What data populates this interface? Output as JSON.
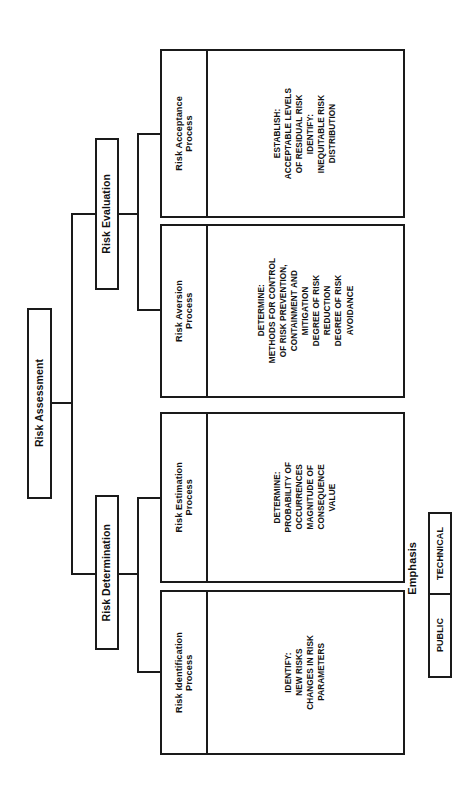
{
  "diagram": {
    "orientation": "rotated-90-counterclockwise",
    "root": {
      "label": "Risk Assessment"
    },
    "branches": [
      {
        "label": "Risk Evaluation"
      },
      {
        "label": "Risk Determination"
      }
    ],
    "processes": [
      {
        "title": "Risk Acceptance\nProcess",
        "body": "ESTABLISH:\nACCEPTABLE LEVELS\nOF RESIDUAL RISK\nIDENTIFY:\nINEQUITABLE RISK\nDISTRIBUTION"
      },
      {
        "title": "Risk Aversion\nProcess",
        "body": "DETERMINE:\nMETHODS FOR CONTROL\nOF RISK PREVENTION,\nCONTAINMENT AND\nMITIGATION\nDEGREE OF RISK\nREDUCTION\nDEGREE OF RISK\nAVOIDANCE"
      },
      {
        "title": "Risk Estimation\nProcess",
        "body": "DETERMINE:\nPROBABILITY OF\nOCCURRENCES\nMAGNITUDE OF\nCONSEQUENCE\nVALUE"
      },
      {
        "title": "Risk Identification\nProcess",
        "body": "IDENTIFY:\nNEW RISKS\nCHANGES IN RISK\nPARAMETERS"
      }
    ]
  },
  "legend": {
    "title": "Emphasis",
    "cells": [
      {
        "label": "TECHNICAL"
      },
      {
        "label": "PUBLIC"
      }
    ]
  },
  "colors": {
    "stroke": "#1a1a1a",
    "background": "#ffffff",
    "text": "#111111"
  }
}
